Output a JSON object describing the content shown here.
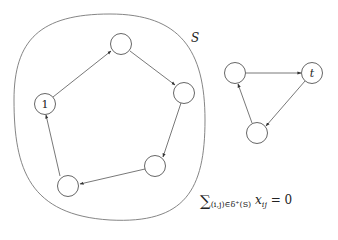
{
  "diagram": {
    "set_label": "S",
    "cycle_in_S": {
      "nodes": [
        {
          "id": "n1",
          "label": "1",
          "x": 45,
          "y": 104
        },
        {
          "id": "n2",
          "label": "",
          "x": 121,
          "y": 44
        },
        {
          "id": "n3",
          "label": "",
          "x": 184,
          "y": 93
        },
        {
          "id": "n4",
          "label": "",
          "x": 155,
          "y": 166
        },
        {
          "id": "n5",
          "label": "",
          "x": 68,
          "y": 186
        }
      ],
      "edges": [
        [
          "n1",
          "n2"
        ],
        [
          "n2",
          "n3"
        ],
        [
          "n3",
          "n4"
        ],
        [
          "n4",
          "n5"
        ],
        [
          "n5",
          "n1"
        ]
      ]
    },
    "cycle_outside": {
      "nodes": [
        {
          "id": "m1",
          "label": "",
          "x": 235,
          "y": 73
        },
        {
          "id": "t",
          "label": "t",
          "x": 312,
          "y": 73
        },
        {
          "id": "m3",
          "label": "",
          "x": 257,
          "y": 133
        }
      ],
      "edges": [
        [
          "m1",
          "t"
        ],
        [
          "t",
          "m3"
        ],
        [
          "m3",
          "m1"
        ]
      ]
    },
    "formula": {
      "sum": "∑",
      "subscript": "(i,j)∈δ⁺(S)",
      "variable": "x",
      "var_subscript": "ij",
      "rhs": " = 0"
    }
  }
}
